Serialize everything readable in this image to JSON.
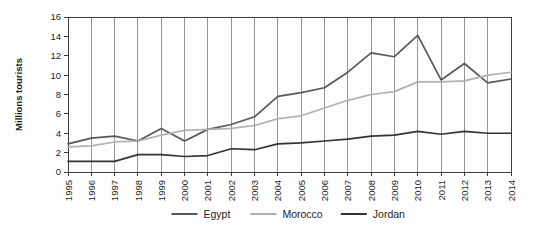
{
  "chart_data": {
    "type": "line",
    "title": "",
    "subtitle": "",
    "xlabel": "",
    "ylabel": "Millions tourists",
    "categories": [
      "1995",
      "1996",
      "1997",
      "1998",
      "1999",
      "2000",
      "2001",
      "2002",
      "2003",
      "2004",
      "2005",
      "2006",
      "2007",
      "2008",
      "2009",
      "2010",
      "2011",
      "2012",
      "2013",
      "2014"
    ],
    "x": [
      1995,
      1996,
      1997,
      1998,
      1999,
      2000,
      2001,
      2002,
      2003,
      2004,
      2005,
      2006,
      2007,
      2008,
      2009,
      2010,
      2011,
      2012,
      2013,
      2014
    ],
    "ylim": [
      0,
      16
    ],
    "yticks": [
      0,
      2,
      4,
      6,
      8,
      10,
      12,
      14,
      16
    ],
    "ytick_labels": [
      "0",
      "2",
      "4",
      "6",
      "8",
      "10",
      "12",
      "14",
      "16"
    ],
    "grid": "vertical-only",
    "legend_position": "bottom-center",
    "xtick_rotation": 90,
    "series": [
      {
        "name": "Egypt",
        "color": "#595959",
        "values": [
          2.9,
          3.5,
          3.7,
          3.2,
          4.5,
          3.2,
          4.4,
          4.9,
          5.7,
          7.8,
          8.2,
          8.7,
          10.3,
          12.3,
          11.9,
          14.1,
          9.5,
          11.2,
          9.2,
          9.6
        ]
      },
      {
        "name": "Morocco",
        "color": "#b0b0b0",
        "values": [
          2.6,
          2.7,
          3.1,
          3.2,
          3.8,
          4.3,
          4.4,
          4.5,
          4.8,
          5.5,
          5.8,
          6.6,
          7.4,
          8.0,
          8.3,
          9.3,
          9.3,
          9.4,
          10.0,
          10.3
        ]
      },
      {
        "name": "Jordan",
        "color": "#333333",
        "values": [
          1.1,
          1.1,
          1.1,
          1.8,
          1.8,
          1.6,
          1.7,
          2.4,
          2.3,
          2.9,
          3.0,
          3.2,
          3.4,
          3.7,
          3.8,
          4.2,
          3.9,
          4.2,
          4.0,
          4.0
        ]
      }
    ]
  },
  "legend": {
    "items": [
      {
        "label": "Egypt",
        "color": "#595959"
      },
      {
        "label": "Morocco",
        "color": "#b0b0b0"
      },
      {
        "label": "Jordan",
        "color": "#333333"
      }
    ]
  },
  "axes": {
    "y_axis_title": "Millions tourists"
  }
}
